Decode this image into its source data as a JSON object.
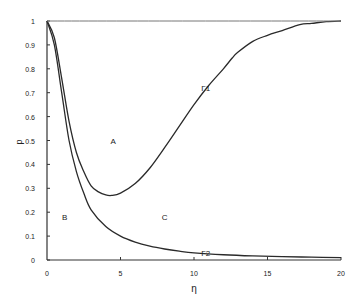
{
  "chart_data": {
    "type": "line",
    "title": "",
    "xlabel": "η",
    "ylabel": "p",
    "xlim": [
      0,
      20
    ],
    "ylim": [
      0,
      1
    ],
    "grid": false,
    "legend": "none",
    "x_ticks": [
      "0",
      "5",
      "10",
      "15",
      "20"
    ],
    "y_ticks": [
      "0",
      "0.1",
      "0.2",
      "0.3",
      "0.4",
      "0.5",
      "0.6",
      "0.7",
      "0.8",
      "0.9",
      "1"
    ],
    "series": [
      {
        "name": "Γ1",
        "x": [
          0,
          0.5,
          1,
          1.5,
          2,
          2.5,
          3,
          3.5,
          4,
          4.4,
          5,
          6,
          7,
          8,
          9,
          10,
          11,
          12,
          12.6,
          13,
          14,
          15,
          16,
          17.2,
          18,
          19,
          20
        ],
        "values": [
          1.0,
          0.93,
          0.76,
          0.58,
          0.45,
          0.37,
          0.31,
          0.285,
          0.272,
          0.27,
          0.28,
          0.32,
          0.385,
          0.47,
          0.56,
          0.65,
          0.73,
          0.8,
          0.845,
          0.87,
          0.915,
          0.94,
          0.96,
          0.985,
          0.99,
          0.997,
          1.0
        ]
      },
      {
        "name": "Γ2",
        "x": [
          0,
          0.5,
          1,
          1.5,
          2,
          2.5,
          3,
          4,
          5,
          6,
          7,
          8,
          9,
          10,
          12,
          14,
          16,
          18,
          20
        ],
        "values": [
          1.0,
          0.9,
          0.7,
          0.5,
          0.37,
          0.28,
          0.21,
          0.14,
          0.1,
          0.075,
          0.058,
          0.046,
          0.037,
          0.03,
          0.022,
          0.017,
          0.014,
          0.012,
          0.01
        ]
      },
      {
        "name": "p=1",
        "x": [
          0,
          20
        ],
        "values": [
          1,
          1
        ]
      }
    ],
    "annotations": [
      {
        "text": "A",
        "x": 4.5,
        "y": 0.5
      },
      {
        "text": "B",
        "x": 1.2,
        "y": 0.18
      },
      {
        "text": "C",
        "x": 8,
        "y": 0.18
      },
      {
        "text": "Γ1",
        "x": 10.8,
        "y": 0.72
      },
      {
        "text": "Γ2",
        "x": 10.8,
        "y": 0.03
      }
    ]
  },
  "labels": {
    "xlabel": "η",
    "ylabel": "p",
    "A": "A",
    "B": "B",
    "C": "C",
    "G1": "Γ1",
    "G2": "Γ2"
  }
}
